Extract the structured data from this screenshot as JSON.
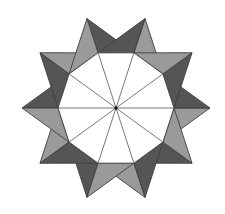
{
  "figure": {
    "center": [
      116,
      108
    ],
    "decagon_radius": 58,
    "peak_radius": 94,
    "vertex_count": 10,
    "start_angle_deg": 0,
    "colors": {
      "background": "#ffffff",
      "light": "#9a9a9a",
      "dark": "#555555",
      "stroke": "#3f3f3f",
      "spoke": "#555555",
      "center_dot": "#111111",
      "interior": "#ffffff"
    },
    "peaks": [
      {
        "angle": 0,
        "plus_half": "light",
        "minus_half": "dark"
      },
      {
        "angle": 36,
        "plus_half": "dark",
        "minus_half": "light"
      },
      {
        "angle": 72,
        "plus_half": "light",
        "minus_half": "dark"
      },
      {
        "angle": 108,
        "plus_half": "dark",
        "minus_half": "light"
      },
      {
        "angle": 144,
        "plus_half": "light",
        "minus_half": "dark"
      },
      {
        "angle": 180,
        "plus_half": "dark",
        "minus_half": "light"
      },
      {
        "angle": 216,
        "plus_half": "light",
        "minus_half": "dark"
      },
      {
        "angle": 252,
        "plus_half": "dark",
        "minus_half": "light"
      },
      {
        "angle": 288,
        "plus_half": "light",
        "minus_half": "dark"
      },
      {
        "angle": 324,
        "plus_half": "dark",
        "minus_half": "light"
      }
    ]
  }
}
